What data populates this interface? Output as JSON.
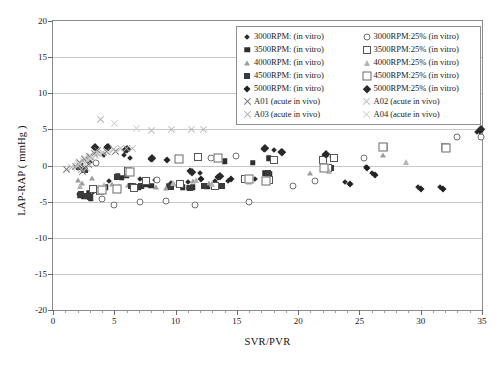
{
  "chart_data": {
    "type": "scatter",
    "title": "",
    "xlabel": "SVR/PVR",
    "ylabel": "LAP-RAP ( mmHg )",
    "xlim": [
      0,
      35
    ],
    "ylim": [
      -20,
      20
    ],
    "xticks": [
      0,
      5,
      10,
      15,
      20,
      25,
      30,
      35
    ],
    "yticks": [
      -20,
      -15,
      -10,
      -5,
      0,
      5,
      10,
      15,
      20
    ],
    "grid": "horizontal",
    "legend_position": "top-right",
    "series": [
      {
        "name": "3000RPM: (in vitro)",
        "marker": "diamond-small-filled",
        "points": [
          [
            2.0,
            -0.4
          ],
          [
            2.3,
            0.2
          ],
          [
            2.6,
            -0.3
          ],
          [
            3.0,
            0.5
          ],
          [
            3.3,
            -3.6
          ],
          [
            2.1,
            -4.0
          ],
          [
            2.4,
            -4.2
          ],
          [
            2.8,
            -4.4
          ],
          [
            4.2,
            1.4
          ],
          [
            4.6,
            -2.1
          ],
          [
            5.8,
            1.5
          ],
          [
            6.3,
            1.0
          ],
          [
            7.1,
            -1.9
          ],
          [
            8.3,
            -2.0
          ],
          [
            9.6,
            -2.4
          ],
          [
            11.0,
            -2.3
          ],
          [
            12.0,
            -1.0
          ],
          [
            13.2,
            -2.2
          ],
          [
            14.3,
            -2.1
          ],
          [
            16.5,
            -1.8
          ],
          [
            17.8,
            0.9
          ],
          [
            18.0,
            2.2
          ],
          [
            22.3,
            1.3
          ],
          [
            22.8,
            1.2
          ],
          [
            25.5,
            -0.2
          ],
          [
            26.0,
            -1.1
          ],
          [
            23.8,
            -2.3
          ],
          [
            29.8,
            -3.0
          ],
          [
            31.6,
            -3.0
          ],
          [
            34.6,
            4.6
          ]
        ]
      },
      {
        "name": "3500RPM: (in vitro)",
        "marker": "square-filled",
        "points": [
          [
            2.2,
            -0.1
          ],
          [
            2.5,
            -0.5
          ],
          [
            2.9,
            -3.8
          ],
          [
            2.2,
            -4.1
          ],
          [
            2.5,
            -4.3
          ],
          [
            3.1,
            -4.5
          ],
          [
            4.3,
            -3.0
          ],
          [
            5.3,
            -1.5
          ],
          [
            5.6,
            -1.7
          ],
          [
            6.0,
            -1.4
          ],
          [
            6.6,
            -2.9
          ],
          [
            7.0,
            -3.0
          ],
          [
            7.6,
            -2.6
          ],
          [
            8.0,
            -2.8
          ],
          [
            9.5,
            -2.9
          ],
          [
            10.6,
            -3.0
          ],
          [
            11.1,
            -3.1
          ],
          [
            11.4,
            -3.0
          ],
          [
            12.6,
            -2.9
          ],
          [
            14.0,
            0.6
          ],
          [
            16.3,
            0.4
          ],
          [
            17.3,
            -1.1
          ],
          [
            17.7,
            -1.2
          ],
          [
            22.5,
            -0.2
          ],
          [
            17.6,
            1.0
          ]
        ]
      },
      {
        "name": "4000RPM: (in vitro)",
        "marker": "triangle-gray-filled",
        "points": [
          [
            2.0,
            -2.0
          ],
          [
            2.4,
            -2.4
          ],
          [
            3.2,
            -1.7
          ],
          [
            4.8,
            -2.6
          ],
          [
            5.4,
            -2.8
          ],
          [
            6.1,
            -2.7
          ],
          [
            7.3,
            -2.9
          ],
          [
            8.4,
            -3.0
          ],
          [
            9.2,
            -3.1
          ],
          [
            9.9,
            -2.6
          ],
          [
            11.4,
            -2.1
          ],
          [
            12.7,
            -2.4
          ],
          [
            16.0,
            -2.3
          ],
          [
            21.0,
            -1.0
          ],
          [
            26.9,
            1.4
          ]
        ]
      },
      {
        "name": "4500RPM: (in vitro)",
        "marker": "square-filled-dark",
        "points": [
          [
            2.1,
            -0.2
          ],
          [
            2.6,
            -0.6
          ],
          [
            2.3,
            -3.9
          ],
          [
            2.7,
            -4.2
          ],
          [
            3.0,
            -4.4
          ],
          [
            5.2,
            -1.6
          ],
          [
            6.4,
            -2.8
          ],
          [
            7.2,
            -2.9
          ],
          [
            9.6,
            -3.0
          ],
          [
            11.2,
            -3.1
          ],
          [
            12.3,
            -2.8
          ],
          [
            13.8,
            -2.9
          ],
          [
            17.5,
            -1.1
          ],
          [
            22.7,
            -0.3
          ]
        ]
      },
      {
        "name": "5000RPM: (in vitro)",
        "marker": "diamond-filled",
        "points": [
          [
            3.4,
            2.4
          ],
          [
            4.4,
            2.5
          ],
          [
            5.9,
            2.2
          ],
          [
            8.0,
            0.9
          ],
          [
            9.3,
            0.7
          ],
          [
            11.2,
            -0.8
          ],
          [
            12.1,
            -1.9
          ],
          [
            13.5,
            -1.6
          ],
          [
            14.5,
            -1.8
          ],
          [
            17.2,
            2.3
          ],
          [
            18.6,
            1.8
          ],
          [
            22.2,
            1.5
          ],
          [
            25.6,
            -0.4
          ],
          [
            26.3,
            -1.3
          ],
          [
            24.2,
            -2.5
          ],
          [
            30.0,
            -3.2
          ],
          [
            31.8,
            -3.2
          ],
          [
            34.8,
            4.8
          ]
        ]
      },
      {
        "name": "3000RPM:25% (in vitro)",
        "marker": "circle-open",
        "points": [
          [
            3.5,
            0.3
          ],
          [
            4.0,
            -4.7
          ],
          [
            5.0,
            -5.4
          ],
          [
            7.1,
            -5.0
          ],
          [
            8.5,
            -2.0
          ],
          [
            9.2,
            -4.9
          ],
          [
            11.6,
            -5.4
          ],
          [
            12.9,
            1.1
          ],
          [
            14.9,
            1.3
          ],
          [
            16.0,
            -5.0
          ],
          [
            19.6,
            -2.8
          ],
          [
            21.4,
            -2.2
          ],
          [
            25.4,
            1.0
          ],
          [
            33.0,
            4.0
          ],
          [
            34.9,
            3.9
          ]
        ]
      },
      {
        "name": "3500RPM:25% (in vitro)",
        "marker": "square-open",
        "points": [
          [
            3.3,
            -3.2
          ],
          [
            3.8,
            -3.5
          ],
          [
            6.1,
            -0.8
          ],
          [
            6.6,
            -3.1
          ],
          [
            7.6,
            -2.2
          ],
          [
            10.4,
            -2.5
          ],
          [
            11.8,
            1.2
          ],
          [
            13.2,
            -2.8
          ],
          [
            15.7,
            -1.9
          ],
          [
            17.6,
            -2.0
          ],
          [
            18.0,
            0.7
          ],
          [
            22.0,
            0.8
          ],
          [
            22.9,
            1.0
          ],
          [
            22.4,
            -0.3
          ],
          [
            27.0,
            2.6
          ],
          [
            32.0,
            2.5
          ]
        ]
      },
      {
        "name": "4000RPM:25% (in vitro)",
        "marker": "triangle-open",
        "points": [
          [
            2.2,
            -2.8
          ],
          [
            4.2,
            -2.7
          ],
          [
            5.1,
            -3.0
          ],
          [
            9.8,
            -2.4
          ],
          [
            11.7,
            -2.0
          ],
          [
            13.0,
            -2.5
          ],
          [
            22.5,
            -0.8
          ],
          [
            28.8,
            0.5
          ]
        ]
      },
      {
        "name": "4500RPM:25% (in vitro)",
        "marker": "square-open-large",
        "points": [
          [
            4.0,
            -3.4
          ],
          [
            5.2,
            -3.3
          ],
          [
            6.3,
            -0.9
          ],
          [
            10.3,
            0.9
          ],
          [
            13.5,
            1.0
          ],
          [
            16.0,
            -1.9
          ],
          [
            17.4,
            -2.1
          ],
          [
            22.1,
            -0.4
          ],
          [
            26.9,
            2.5
          ],
          [
            32.1,
            2.4
          ]
        ]
      },
      {
        "name": "5000RPM:25% (in vitro)",
        "marker": "diamond-filled-large",
        "points": [
          [
            3.4,
            2.6
          ],
          [
            4.5,
            2.6
          ],
          [
            6.0,
            2.3
          ],
          [
            8.1,
            1.0
          ],
          [
            11.3,
            -0.9
          ],
          [
            13.6,
            -1.5
          ],
          [
            17.3,
            2.4
          ],
          [
            18.7,
            1.9
          ],
          [
            22.3,
            1.6
          ],
          [
            34.9,
            5.0
          ]
        ]
      },
      {
        "name": "A01 (acute in vivo)",
        "marker": "x-dark",
        "points": [
          [
            1.1,
            -0.6
          ],
          [
            1.8,
            -0.2
          ],
          [
            2.2,
            0.4
          ],
          [
            2.6,
            0.8
          ],
          [
            3.0,
            1.2
          ],
          [
            3.4,
            1.6
          ],
          [
            2.4,
            -0.8
          ],
          [
            2.9,
            0.1
          ],
          [
            3.6,
            2.1
          ],
          [
            4.4,
            1.9
          ],
          [
            5.1,
            2.0
          ]
        ]
      },
      {
        "name": "A02 (acute in vivo)",
        "marker": "x-light",
        "points": [
          [
            2.0,
            0.0
          ],
          [
            2.5,
            0.5
          ],
          [
            3.0,
            1.0
          ],
          [
            3.5,
            1.4
          ],
          [
            4.0,
            1.8
          ],
          [
            2.7,
            -0.4
          ],
          [
            5.5,
            2.3
          ],
          [
            6.5,
            2.3
          ],
          [
            8.0,
            4.9
          ],
          [
            9.7,
            5.0
          ],
          [
            11.3,
            5.0
          ],
          [
            12.3,
            5.0
          ]
        ]
      },
      {
        "name": "A03 (acute in vivo)",
        "marker": "x-mid",
        "points": [
          [
            1.5,
            -0.3
          ],
          [
            2.1,
            0.3
          ],
          [
            2.6,
            0.9
          ],
          [
            3.1,
            1.3
          ],
          [
            3.6,
            1.7
          ],
          [
            2.3,
            -0.5
          ],
          [
            3.9,
            6.4
          ],
          [
            4.9,
            2.2
          ],
          [
            6.0,
            2.4
          ]
        ]
      },
      {
        "name": "A04 (acute in vivo)",
        "marker": "x-pale",
        "points": [
          [
            2.2,
            0.2
          ],
          [
            2.8,
            0.7
          ],
          [
            3.2,
            1.1
          ],
          [
            3.8,
            1.5
          ],
          [
            4.5,
            1.8
          ],
          [
            5.0,
            5.8
          ],
          [
            6.8,
            5.1
          ]
        ]
      }
    ]
  },
  "axes": {
    "x": {
      "label": "SVR/PVR",
      "ticks": [
        "0",
        "5",
        "10",
        "15",
        "20",
        "25",
        "30",
        "35"
      ]
    },
    "y": {
      "label": "LAP-RAP ( mmHg )",
      "ticks": [
        "20",
        "15",
        "10",
        "5",
        "0",
        "-5",
        "-10",
        "-15",
        "-20"
      ]
    }
  },
  "legend": {
    "items": [
      {
        "label": "3000RPM: (in vitro)",
        "marker": "diamond-small-filled"
      },
      {
        "label": "3000RPM:25% (in vitro)",
        "marker": "circle-open"
      },
      {
        "label": "3500RPM: (in vitro)",
        "marker": "square-filled"
      },
      {
        "label": "3500RPM:25% (in vitro)",
        "marker": "square-open"
      },
      {
        "label": "4000RPM: (in vitro)",
        "marker": "triangle-gray-filled"
      },
      {
        "label": "4000RPM:25% (in vitro)",
        "marker": "triangle-open"
      },
      {
        "label": "4500RPM: (in vitro)",
        "marker": "square-filled-dark"
      },
      {
        "label": "4500RPM:25% (in vitro)",
        "marker": "square-open-large"
      },
      {
        "label": "5000RPM: (in vitro)",
        "marker": "diamond-filled"
      },
      {
        "label": "5000RPM:25% (in vitro)",
        "marker": "diamond-filled-large"
      },
      {
        "label": "A01 (acute in vivo)",
        "marker": "x-dark"
      },
      {
        "label": "A02 (acute in vivo)",
        "marker": "x-light"
      },
      {
        "label": "A03 (acute in vivo)",
        "marker": "x-mid"
      },
      {
        "label": "A04 (acute in vivo)",
        "marker": "x-pale"
      }
    ]
  },
  "colors": {
    "frame": "#8a8a8a",
    "grid": "#c9c9c9",
    "text": "#1a1a1a",
    "marker_dark": "#2b2b2b",
    "marker_light": "#b4b4b4"
  }
}
